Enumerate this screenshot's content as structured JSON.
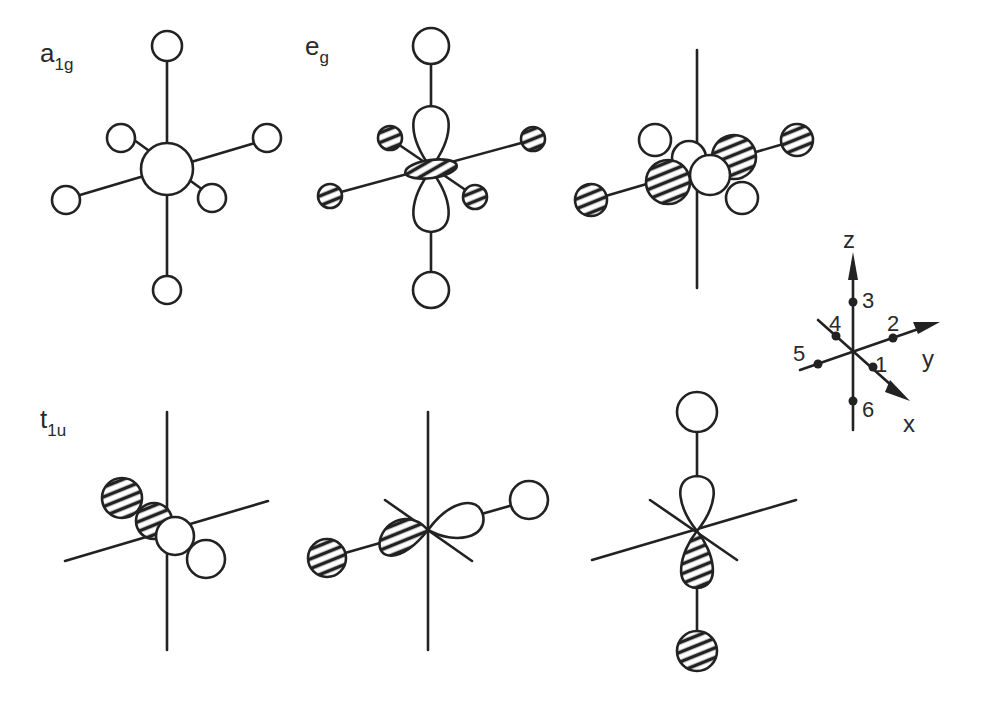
{
  "figure": {
    "panels": [
      {
        "id": "a1g",
        "label_main": "a",
        "label_sub": "1g",
        "caption": "a1g: central s orbital with six in-phase (white) ligand orbitals"
      },
      {
        "id": "eg-1",
        "label_main": "e",
        "label_sub": "g",
        "caption": "eg: dz2 orbital with white axial ligands and hatched equatorial ligands"
      },
      {
        "id": "eg-2",
        "label_main": "",
        "label_sub": "",
        "caption": "eg: dx2-y2 orbital with alternating-phase equatorial ligands"
      },
      {
        "id": "t1u-1",
        "label_main": "t",
        "label_sub": "1u",
        "caption": "t1u: px orbital with ligands 1 and 4"
      },
      {
        "id": "t1u-2",
        "label_main": "",
        "label_sub": "",
        "caption": "t1u: py orbital with ligands 2 and 5"
      },
      {
        "id": "t1u-3",
        "label_main": "",
        "label_sub": "",
        "caption": "t1u: pz orbital with ligands 3 and 6"
      }
    ],
    "axes_key": {
      "axis_labels": {
        "x": "x",
        "y": "y",
        "z": "z"
      },
      "ligand_numbers": [
        "1",
        "2",
        "3",
        "4",
        "5",
        "6"
      ]
    },
    "legend_phases": {
      "positive": "white",
      "negative": "hatched"
    },
    "colors": {
      "line": "#222222",
      "background": "#ffffff",
      "text": "#2a2a2a"
    }
  }
}
